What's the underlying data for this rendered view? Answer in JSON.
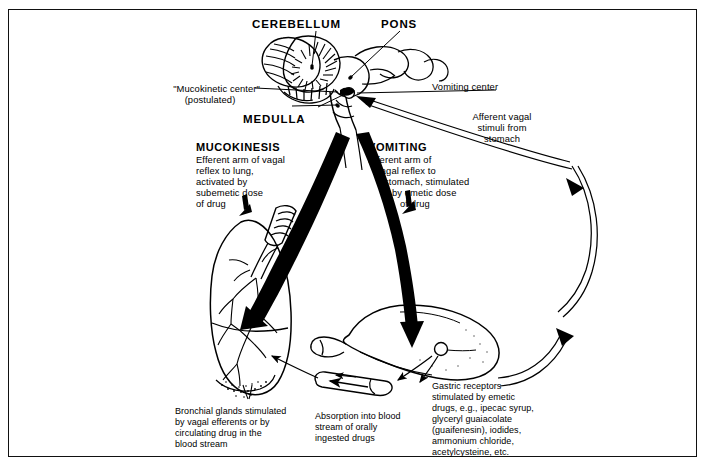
{
  "figure": {
    "title_alt": "Mucokinesis and vomiting vagal reflex pathways",
    "frame_color": "#111111",
    "ink_color": "#000000",
    "background": "#ffffff"
  },
  "anatomy_labels": {
    "cerebellum": "CEREBELLUM",
    "pons": "PONS",
    "medulla": "MEDULLA",
    "mucokinetic_center": "\"Mucokinetic center\"",
    "mucokinetic_center_sub": "(postulated)",
    "vomiting_center": "Vomiting center"
  },
  "pathways": {
    "mucokinesis": {
      "heading": "MUCOKINESIS",
      "line1": "Efferent arm of vagal",
      "line2": "reflex to lung,",
      "line3": "activated by",
      "line4": "subemetic dose",
      "line5": "of drug"
    },
    "vomiting": {
      "heading": "VOMITING",
      "line1": "Efferent arm of",
      "line2": "vagal reflex to",
      "line3": "stomach, stimulated",
      "line4": "by emetic dose",
      "line5": "of drug"
    },
    "afferent": {
      "line1": "Afferent vagal",
      "line2": "stimuli from",
      "line3": "stomach"
    }
  },
  "captions": {
    "bronchial": {
      "line1": "Bronchial glands stimulated",
      "line2": "by vagal efferents or by",
      "line3": "circulating drug in the",
      "line4": "blood stream"
    },
    "absorption": {
      "line1": "Absorption into blood",
      "line2": "stream of orally",
      "line3": "ingested drugs"
    },
    "gastric": {
      "line1": "Gastric receptors",
      "line2": "stimulated by emetic",
      "line3": "drugs, e.g., ipecac syrup,",
      "line4": "glyceryl guaiacolate",
      "line5": "(guaifenesin), iodides,",
      "line6": "ammonium chloride,",
      "line7": "acetylcysteine, etc."
    }
  }
}
